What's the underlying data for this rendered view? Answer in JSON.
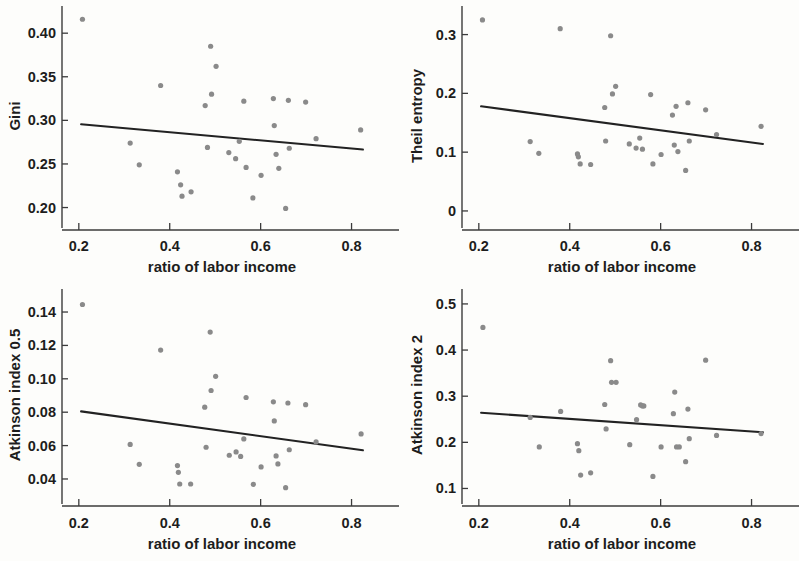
{
  "figure": {
    "background_color": "#fdfdfb",
    "dot_color": "#8a8a8a",
    "line_color": "#222222",
    "axis_color": "#3b3b3b",
    "panel_count": 4
  },
  "chart_data": [
    {
      "type": "scatter",
      "title": "",
      "xlabel": "ratio of labor income",
      "ylabel": "Gini",
      "xlim": [
        0.185,
        0.845
      ],
      "ylim": [
        0.188,
        0.422
      ],
      "xticks": [
        0.2,
        0.4,
        0.6,
        0.8
      ],
      "xticklabels": [
        "0.2",
        "0.4",
        "0.6",
        "0.8"
      ],
      "yticks": [
        0.2,
        0.25,
        0.3,
        0.35,
        0.4
      ],
      "yticklabels": [
        "0.20",
        "0.25",
        "0.30",
        "0.35",
        "0.40"
      ],
      "grid": false,
      "legend": null,
      "trendline": {
        "x": [
          0.205,
          0.825
        ],
        "y": [
          0.2955,
          0.2665
        ]
      },
      "points": [
        {
          "x": 0.208,
          "y": 0.416
        },
        {
          "x": 0.313,
          "y": 0.274
        },
        {
          "x": 0.333,
          "y": 0.249
        },
        {
          "x": 0.38,
          "y": 0.34
        },
        {
          "x": 0.417,
          "y": 0.241
        },
        {
          "x": 0.424,
          "y": 0.226
        },
        {
          "x": 0.427,
          "y": 0.213
        },
        {
          "x": 0.447,
          "y": 0.218
        },
        {
          "x": 0.478,
          "y": 0.317
        },
        {
          "x": 0.483,
          "y": 0.269
        },
        {
          "x": 0.49,
          "y": 0.385
        },
        {
          "x": 0.492,
          "y": 0.33
        },
        {
          "x": 0.502,
          "y": 0.362
        },
        {
          "x": 0.53,
          "y": 0.263
        },
        {
          "x": 0.545,
          "y": 0.256
        },
        {
          "x": 0.553,
          "y": 0.276
        },
        {
          "x": 0.563,
          "y": 0.322
        },
        {
          "x": 0.568,
          "y": 0.246
        },
        {
          "x": 0.583,
          "y": 0.211
        },
        {
          "x": 0.601,
          "y": 0.237
        },
        {
          "x": 0.628,
          "y": 0.325
        },
        {
          "x": 0.63,
          "y": 0.294
        },
        {
          "x": 0.634,
          "y": 0.261
        },
        {
          "x": 0.64,
          "y": 0.245
        },
        {
          "x": 0.655,
          "y": 0.199
        },
        {
          "x": 0.661,
          "y": 0.323
        },
        {
          "x": 0.663,
          "y": 0.268
        },
        {
          "x": 0.699,
          "y": 0.321
        },
        {
          "x": 0.722,
          "y": 0.279
        },
        {
          "x": 0.82,
          "y": 0.289
        }
      ]
    },
    {
      "type": "scatter",
      "title": "",
      "xlabel": "ratio of labor income",
      "ylabel": "Theil entropy",
      "xlim": [
        0.185,
        0.845
      ],
      "ylim": [
        -0.012,
        0.335
      ],
      "xticks": [
        0.2,
        0.4,
        0.6,
        0.8
      ],
      "xticklabels": [
        "0.2",
        "0.4",
        "0.6",
        "0.8"
      ],
      "yticks": [
        0,
        0.1,
        0.2,
        0.3
      ],
      "yticklabels": [
        "0",
        "0.1",
        "0.2",
        "0.3"
      ],
      "grid": false,
      "legend": null,
      "trendline": {
        "x": [
          0.205,
          0.825
        ],
        "y": [
          0.178,
          0.114
        ]
      },
      "points": [
        {
          "x": 0.208,
          "y": 0.325
        },
        {
          "x": 0.313,
          "y": 0.118
        },
        {
          "x": 0.332,
          "y": 0.098
        },
        {
          "x": 0.379,
          "y": 0.31
        },
        {
          "x": 0.417,
          "y": 0.097
        },
        {
          "x": 0.419,
          "y": 0.092
        },
        {
          "x": 0.423,
          "y": 0.08
        },
        {
          "x": 0.446,
          "y": 0.079
        },
        {
          "x": 0.477,
          "y": 0.176
        },
        {
          "x": 0.479,
          "y": 0.119
        },
        {
          "x": 0.49,
          "y": 0.298
        },
        {
          "x": 0.494,
          "y": 0.199
        },
        {
          "x": 0.501,
          "y": 0.212
        },
        {
          "x": 0.531,
          "y": 0.114
        },
        {
          "x": 0.546,
          "y": 0.107
        },
        {
          "x": 0.554,
          "y": 0.124
        },
        {
          "x": 0.56,
          "y": 0.105
        },
        {
          "x": 0.578,
          "y": 0.198
        },
        {
          "x": 0.583,
          "y": 0.08
        },
        {
          "x": 0.601,
          "y": 0.096
        },
        {
          "x": 0.626,
          "y": 0.163
        },
        {
          "x": 0.63,
          "y": 0.112
        },
        {
          "x": 0.634,
          "y": 0.178
        },
        {
          "x": 0.638,
          "y": 0.101
        },
        {
          "x": 0.655,
          "y": 0.069
        },
        {
          "x": 0.66,
          "y": 0.184
        },
        {
          "x": 0.663,
          "y": 0.119
        },
        {
          "x": 0.699,
          "y": 0.172
        },
        {
          "x": 0.723,
          "y": 0.13
        },
        {
          "x": 0.821,
          "y": 0.144
        }
      ]
    },
    {
      "type": "scatter",
      "title": "",
      "xlabel": "ratio of labor income",
      "ylabel": "Atkinson index 0.5",
      "xlim": [
        0.185,
        0.845
      ],
      "ylim": [
        0.031,
        0.149
      ],
      "xticks": [
        0.2,
        0.4,
        0.6,
        0.8
      ],
      "xticklabels": [
        "0.2",
        "0.4",
        "0.6",
        "0.8"
      ],
      "yticks": [
        0.04,
        0.06,
        0.08,
        0.1,
        0.12,
        0.14
      ],
      "yticklabels": [
        "0.04",
        "0.06",
        "0.08",
        "0.10",
        "0.12",
        "0.14"
      ],
      "grid": false,
      "legend": null,
      "trendline": {
        "x": [
          0.205,
          0.825
        ],
        "y": [
          0.0805,
          0.0572
        ]
      },
      "points": [
        {
          "x": 0.208,
          "y": 0.1445
        },
        {
          "x": 0.313,
          "y": 0.0607
        },
        {
          "x": 0.333,
          "y": 0.0488
        },
        {
          "x": 0.38,
          "y": 0.1172
        },
        {
          "x": 0.417,
          "y": 0.048
        },
        {
          "x": 0.419,
          "y": 0.044
        },
        {
          "x": 0.422,
          "y": 0.037
        },
        {
          "x": 0.446,
          "y": 0.037
        },
        {
          "x": 0.477,
          "y": 0.083
        },
        {
          "x": 0.48,
          "y": 0.059
        },
        {
          "x": 0.489,
          "y": 0.128
        },
        {
          "x": 0.491,
          "y": 0.093
        },
        {
          "x": 0.501,
          "y": 0.1015
        },
        {
          "x": 0.531,
          "y": 0.0542
        },
        {
          "x": 0.546,
          "y": 0.0562
        },
        {
          "x": 0.556,
          "y": 0.0535
        },
        {
          "x": 0.563,
          "y": 0.064
        },
        {
          "x": 0.568,
          "y": 0.0888
        },
        {
          "x": 0.584,
          "y": 0.0368
        },
        {
          "x": 0.601,
          "y": 0.0472
        },
        {
          "x": 0.628,
          "y": 0.0862
        },
        {
          "x": 0.63,
          "y": 0.0748
        },
        {
          "x": 0.634,
          "y": 0.0538
        },
        {
          "x": 0.638,
          "y": 0.049
        },
        {
          "x": 0.655,
          "y": 0.0348
        },
        {
          "x": 0.66,
          "y": 0.0855
        },
        {
          "x": 0.663,
          "y": 0.0575
        },
        {
          "x": 0.699,
          "y": 0.0845
        },
        {
          "x": 0.722,
          "y": 0.0622
        },
        {
          "x": 0.821,
          "y": 0.067
        }
      ]
    },
    {
      "type": "scatter",
      "title": "",
      "xlabel": "ratio of labor income",
      "ylabel": "Atkinson index 2",
      "xlim": [
        0.185,
        0.845
      ],
      "ylim": [
        0.088,
        0.515
      ],
      "xticks": [
        0.2,
        0.4,
        0.6,
        0.8
      ],
      "xticklabels": [
        "0.2",
        "0.4",
        "0.6",
        "0.8"
      ],
      "yticks": [
        0.1,
        0.2,
        0.3,
        0.4,
        0.5
      ],
      "yticklabels": [
        "0.1",
        "0.2",
        "0.3",
        "0.4",
        "0.5"
      ],
      "grid": false,
      "legend": null,
      "trendline": {
        "x": [
          0.205,
          0.825
        ],
        "y": [
          0.264,
          0.222
        ]
      },
      "points": [
        {
          "x": 0.209,
          "y": 0.449
        },
        {
          "x": 0.313,
          "y": 0.254
        },
        {
          "x": 0.333,
          "y": 0.19
        },
        {
          "x": 0.38,
          "y": 0.267
        },
        {
          "x": 0.417,
          "y": 0.197
        },
        {
          "x": 0.42,
          "y": 0.182
        },
        {
          "x": 0.424,
          "y": 0.129
        },
        {
          "x": 0.446,
          "y": 0.134
        },
        {
          "x": 0.477,
          "y": 0.282
        },
        {
          "x": 0.48,
          "y": 0.229
        },
        {
          "x": 0.49,
          "y": 0.377
        },
        {
          "x": 0.492,
          "y": 0.33
        },
        {
          "x": 0.502,
          "y": 0.33
        },
        {
          "x": 0.532,
          "y": 0.195
        },
        {
          "x": 0.547,
          "y": 0.249
        },
        {
          "x": 0.556,
          "y": 0.281
        },
        {
          "x": 0.56,
          "y": 0.279
        },
        {
          "x": 0.563,
          "y": 0.279
        },
        {
          "x": 0.583,
          "y": 0.126
        },
        {
          "x": 0.601,
          "y": 0.19
        },
        {
          "x": 0.628,
          "y": 0.262
        },
        {
          "x": 0.631,
          "y": 0.309
        },
        {
          "x": 0.635,
          "y": 0.19
        },
        {
          "x": 0.641,
          "y": 0.19
        },
        {
          "x": 0.655,
          "y": 0.158
        },
        {
          "x": 0.66,
          "y": 0.272
        },
        {
          "x": 0.663,
          "y": 0.208
        },
        {
          "x": 0.699,
          "y": 0.378
        },
        {
          "x": 0.723,
          "y": 0.215
        },
        {
          "x": 0.821,
          "y": 0.219
        }
      ]
    }
  ]
}
